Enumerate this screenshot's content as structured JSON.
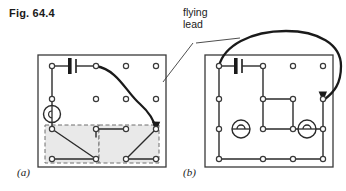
{
  "figure": {
    "caption": "Fig. 64.4",
    "annotation_label": "flying\nlead",
    "annotation_line1": "flying",
    "annotation_line2": "lead",
    "panel_a_label": "(a)",
    "panel_b_label": "(b)"
  },
  "colors": {
    "ink": "#1a1a1a",
    "wire": "#2b2b2b",
    "board_border": "#3a3a3a",
    "hole_ring": "#3a3a3a",
    "hole_fill": "#ffffff",
    "dashed_region_fill": "#e9e9e9",
    "dashed_region_stroke": "#6e6e6e",
    "background": "#ffffff",
    "leader_line": "#3a3a3a"
  },
  "diagram": {
    "type": "circuit-board-wiring-diagram",
    "panels": [
      {
        "id": "a",
        "label": "(a)",
        "board": {
          "x": 38,
          "y": 55,
          "width": 128,
          "height": 112
        },
        "hole_grid": {
          "columns": 4,
          "rows": 4,
          "x_positions": [
            52,
            96,
            126,
            156
          ],
          "y_positions": [
            66,
            99,
            129,
            159
          ]
        },
        "components": [
          {
            "name": "battery",
            "type": "battery-symbol",
            "from_hole": [
              0,
              0
            ],
            "to_hole": [
              1,
              0
            ]
          },
          {
            "name": "lamp",
            "type": "lamp-symbol",
            "at_hole": [
              0,
              2
            ],
            "orientation": "vertical"
          }
        ],
        "dashed_regions": [
          {
            "name": "lamp-position-left",
            "x": 45,
            "y": 125,
            "width": 54,
            "height": 38
          },
          {
            "name": "lamp-position-right",
            "x": 99,
            "y": 125,
            "width": 60,
            "height": 38
          }
        ],
        "flying_lead": {
          "from_hole": [
            1,
            0
          ],
          "to_hole": [
            3,
            2
          ],
          "style": "curved-thick-with-arrow"
        }
      },
      {
        "id": "b",
        "label": "(b)",
        "board": {
          "x": 205,
          "y": 55,
          "width": 128,
          "height": 112
        },
        "hole_grid": {
          "columns": 4,
          "rows": 4,
          "x_positions": [
            219,
            263,
            293,
            323
          ],
          "y_positions": [
            66,
            99,
            129,
            159
          ]
        },
        "components": [
          {
            "name": "battery",
            "type": "battery-symbol",
            "from_hole": [
              0,
              0
            ],
            "to_hole": [
              1,
              0
            ]
          },
          {
            "name": "lamp-left",
            "type": "lamp-symbol",
            "at_hole": [
              0,
              2
            ],
            "orientation": "horizontal"
          },
          {
            "name": "lamp-right",
            "type": "lamp-symbol",
            "at_hole": [
              2,
              2
            ],
            "orientation": "horizontal"
          }
        ],
        "flying_lead": {
          "from_hole": [
            0,
            0
          ],
          "to_hole": [
            3,
            1
          ],
          "style": "large-loop-over-top-with-arrow"
        }
      }
    ],
    "leader_lines": [
      {
        "name": "leader-to-panel-a",
        "from": [
          193,
          42
        ],
        "to": [
          163,
          82
        ]
      },
      {
        "name": "leader-to-panel-b",
        "from": [
          205,
          42
        ],
        "to": [
          240,
          38
        ]
      }
    ]
  }
}
